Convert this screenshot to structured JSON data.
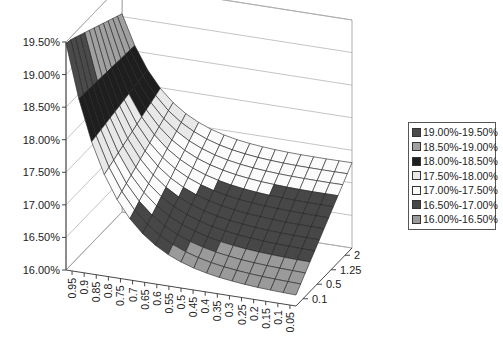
{
  "chart_data": {
    "type": "surface",
    "title": "",
    "xlabel": "",
    "ylabel": "",
    "zlabel": "",
    "z_axis_ticks": [
      "16.00%",
      "16.50%",
      "17.00%",
      "17.50%",
      "18.00%",
      "18.50%",
      "19.00%",
      "19.50%"
    ],
    "zlim": [
      0.16,
      0.195
    ],
    "x_axis_ticks": [
      "0.95",
      "0.9",
      "0.85",
      "0.8",
      "0.75",
      "0.7",
      "0.65",
      "0.6",
      "0.55",
      "0.5",
      "0.45",
      "0.4",
      "0.35",
      "0.3",
      "0.25",
      "0.2",
      "0.15",
      "0.1",
      "0.05"
    ],
    "depth_axis_ticks": [
      "0.1",
      "0.5",
      "1.25",
      "2"
    ],
    "grid": true,
    "legend_position": "right",
    "legend": [
      {
        "label": "19.00%-19.50%",
        "color": "#4a4a4a"
      },
      {
        "label": "18.50%-19.00%",
        "color": "#a0a0a0"
      },
      {
        "label": "18.00%-18.50%",
        "color": "#1e1e1e"
      },
      {
        "label": "17.50%-18.00%",
        "color": "#e8e8e8"
      },
      {
        "label": "17.00%-17.50%",
        "color": "#fbfbfb"
      },
      {
        "label": "16.50%-17.00%",
        "color": "#474747"
      },
      {
        "label": "16.00%-16.50%",
        "color": "#9a9a9a"
      }
    ]
  }
}
